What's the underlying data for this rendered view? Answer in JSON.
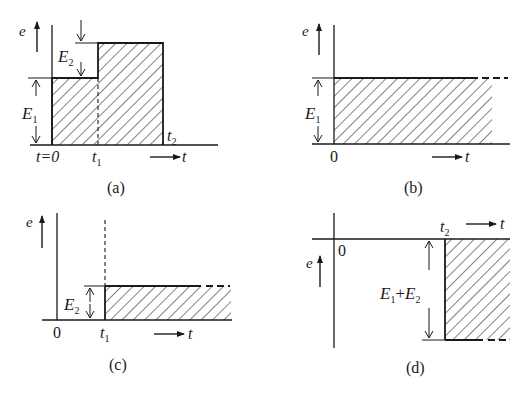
{
  "figure": {
    "panels": [
      {
        "id": "a",
        "caption": "(a)",
        "axis_y_label": "e",
        "axis_x_label": "t",
        "origin_label": "t=0",
        "t1_label": "t",
        "t1_sub": "1",
        "t2_label": "t",
        "t2_sub": "2",
        "e1_label": "E",
        "e1_sub": "1",
        "e2_label": "E",
        "e2_sub": "2",
        "shape": "Pulse: level E1 from t=0 to t1, level E1+E2 from t1 to t2, zero after t2"
      },
      {
        "id": "b",
        "caption": "(b)",
        "axis_y_label": "e",
        "axis_x_label": "t",
        "origin_label": "0",
        "e1_label": "E",
        "e1_sub": "1",
        "shape": "Step of height E1 starting at t=0, continuing indefinitely"
      },
      {
        "id": "c",
        "caption": "(c)",
        "axis_y_label": "e",
        "axis_x_label": "t",
        "origin_label": "0",
        "t1_label": "t",
        "t1_sub": "1",
        "e2_label": "E",
        "e2_sub": "2",
        "shape": "Step of height E2 starting at t1, continuing indefinitely"
      },
      {
        "id": "d",
        "caption": "(d)",
        "axis_y_label": "e",
        "axis_x_label": "t",
        "origin_label": "0",
        "t2_label": "t",
        "t2_sub": "2",
        "sum_label_e1": "E",
        "sum_sub_1": "1",
        "sum_plus": "+",
        "sum_label_e2": "E",
        "sum_sub_2": "2",
        "shape": "Negative step of magnitude E1+E2 starting at t2, continuing indefinitely"
      }
    ],
    "colors": {
      "ink": "#1a1a1a",
      "background": "#ffffff"
    }
  }
}
